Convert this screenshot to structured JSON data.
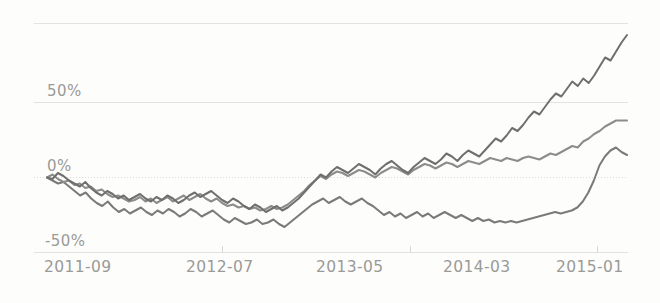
{
  "chart_data": {
    "type": "line",
    "title": "",
    "subtitle": "",
    "xlabel": "",
    "ylabel": "",
    "grid": true,
    "legend_position": "none",
    "ylim": [
      -50,
      110
    ],
    "ytick_values": [
      -50,
      0,
      50,
      100
    ],
    "ytick_labels": [
      "-50%",
      "0%",
      "50%",
      ""
    ],
    "xtick_labels": [
      "2011-09",
      "2012-07",
      "2013-05",
      "2014-03",
      "2015-01"
    ],
    "xtick_positions": [
      0,
      22,
      44,
      66,
      88
    ],
    "x_unit": "month index from 2011-09",
    "x_range": [
      0,
      100
    ],
    "series": [
      {
        "name": "series-1",
        "color": "#6f6f6f",
        "values": [
          0,
          -1,
          3,
          1,
          -2,
          -4,
          -6,
          -3,
          -7,
          -10,
          -12,
          -9,
          -11,
          -14,
          -12,
          -15,
          -13,
          -11,
          -14,
          -16,
          -13,
          -15,
          -12,
          -14,
          -17,
          -15,
          -12,
          -10,
          -13,
          -11,
          -9,
          -12,
          -15,
          -17,
          -14,
          -16,
          -19,
          -21,
          -18,
          -20,
          -23,
          -21,
          -19,
          -22,
          -20,
          -17,
          -14,
          -10,
          -6,
          -2,
          2,
          0,
          4,
          7,
          5,
          3,
          6,
          9,
          7,
          5,
          2,
          6,
          9,
          11,
          8,
          5,
          3,
          7,
          10,
          13,
          11,
          9,
          12,
          16,
          14,
          11,
          15,
          18,
          16,
          14,
          18,
          22,
          26,
          24,
          28,
          33,
          31,
          35,
          40,
          44,
          42,
          47,
          52,
          56,
          54,
          59,
          64,
          61,
          66,
          63,
          68,
          74,
          80,
          78,
          84,
          90,
          95
        ]
      },
      {
        "name": "series-2",
        "color": "#8c8c8c",
        "values": [
          0,
          2,
          -1,
          -3,
          -2,
          -5,
          -4,
          -7,
          -6,
          -9,
          -8,
          -11,
          -13,
          -12,
          -14,
          -16,
          -15,
          -13,
          -16,
          -14,
          -17,
          -15,
          -13,
          -16,
          -14,
          -12,
          -15,
          -13,
          -11,
          -14,
          -16,
          -14,
          -17,
          -19,
          -18,
          -20,
          -19,
          -21,
          -20,
          -22,
          -21,
          -19,
          -21,
          -20,
          -18,
          -15,
          -12,
          -9,
          -5,
          -2,
          1,
          -1,
          2,
          4,
          3,
          1,
          3,
          5,
          4,
          2,
          0,
          3,
          5,
          7,
          6,
          4,
          2,
          5,
          7,
          9,
          8,
          6,
          8,
          10,
          9,
          7,
          9,
          11,
          10,
          9,
          11,
          13,
          12,
          11,
          13,
          12,
          11,
          13,
          14,
          13,
          12,
          14,
          16,
          15,
          17,
          19,
          21,
          20,
          24,
          26,
          29,
          31,
          34,
          36,
          38,
          38,
          38
        ]
      },
      {
        "name": "series-3",
        "color": "#7a7a7a",
        "values": [
          0,
          -2,
          -4,
          -3,
          -6,
          -9,
          -12,
          -10,
          -14,
          -17,
          -19,
          -16,
          -20,
          -23,
          -21,
          -24,
          -22,
          -20,
          -23,
          -25,
          -22,
          -24,
          -21,
          -23,
          -26,
          -24,
          -21,
          -23,
          -26,
          -24,
          -22,
          -25,
          -28,
          -30,
          -27,
          -29,
          -31,
          -30,
          -28,
          -31,
          -30,
          -28,
          -31,
          -33,
          -30,
          -27,
          -24,
          -21,
          -18,
          -16,
          -14,
          -17,
          -15,
          -13,
          -16,
          -18,
          -16,
          -14,
          -17,
          -19,
          -22,
          -25,
          -23,
          -26,
          -24,
          -27,
          -25,
          -23,
          -26,
          -24,
          -27,
          -25,
          -23,
          -25,
          -27,
          -25,
          -27,
          -29,
          -27,
          -29,
          -28,
          -30,
          -29,
          -30,
          -29,
          -30,
          -29,
          -28,
          -27,
          -26,
          -25,
          -24,
          -23,
          -24,
          -23,
          -22,
          -20,
          -16,
          -10,
          -2,
          8,
          14,
          18,
          20,
          17,
          15
        ]
      }
    ]
  },
  "axes": {
    "y_labels": [
      {
        "text": "50%",
        "value": 50
      },
      {
        "text": "0%",
        "value": 0
      },
      {
        "text": "-50%",
        "value": -50
      }
    ],
    "x_labels": [
      {
        "text": "2011-09"
      },
      {
        "text": "2012-07"
      },
      {
        "text": "2013-05"
      },
      {
        "text": "2014-03"
      },
      {
        "text": "2015-01"
      }
    ]
  },
  "colors": {
    "background": "#fdfdfc",
    "grid": "#e3e3e0",
    "tick_text": "#9a9a97",
    "series_1": "#6f6f6f",
    "series_2": "#8c8c8c",
    "series_3": "#7a7a7a"
  }
}
